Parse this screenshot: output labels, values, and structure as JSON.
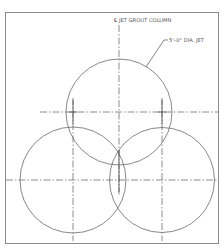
{
  "drawing": {
    "centerline_label": "℄ JET GROUT COLUMN",
    "diameter_label": "5'–0\" DIA. JET",
    "columns": [
      {
        "name": "top",
        "diameter": "5'-0\""
      },
      {
        "name": "bottom-left",
        "diameter": "5'-0\""
      },
      {
        "name": "bottom-right",
        "diameter": "5'-0\""
      }
    ],
    "colors": {
      "line": "#6a6a6a",
      "frame": "#8a8a8a",
      "background": "#ffffff"
    }
  }
}
